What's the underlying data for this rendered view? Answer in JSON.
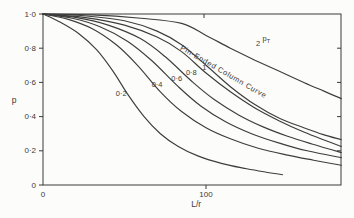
{
  "figure": {
    "background": "#fcfcfa",
    "frame_color": "#3a3a3a",
    "curve_color": "#3d3d3d",
    "text_color": "#3b3b3b"
  },
  "chart_data": {
    "type": "line",
    "title": "",
    "xlabel": "L/r",
    "ylabel": "p",
    "xlim": [
      0,
      183
    ],
    "ylim": [
      0,
      1.0
    ],
    "grid": false,
    "legend": "none",
    "xticks": {
      "values": [
        0,
        100
      ],
      "labels": [
        "0",
        "100"
      ]
    },
    "yticks": {
      "values": [
        1.0,
        0.8,
        0.6,
        0.4,
        0.2,
        0
      ],
      "labels": [
        "1·0",
        "0·8",
        "0·6",
        "0·4",
        "0·2",
        "0"
      ]
    },
    "right_tick_values": [
      0.8,
      0.6,
      0.4,
      0.2
    ],
    "top_tick_values": [
      100
    ],
    "series": [
      {
        "name": "curve-rho-0-2",
        "label": "0·2",
        "label_at": [
          48,
          0.52
        ],
        "points": [
          [
            0,
            1.0
          ],
          [
            10,
            0.955
          ],
          [
            22,
            0.885
          ],
          [
            33,
            0.79
          ],
          [
            43,
            0.665
          ],
          [
            52,
            0.53
          ],
          [
            62,
            0.4
          ],
          [
            72,
            0.3
          ],
          [
            83,
            0.225
          ],
          [
            95,
            0.17
          ],
          [
            110,
            0.125
          ],
          [
            125,
            0.095
          ],
          [
            137,
            0.075
          ],
          [
            147,
            0.06
          ]
        ]
      },
      {
        "name": "curve-rho-0-4",
        "label": "0·4",
        "label_at": [
          70,
          0.575
        ],
        "points": [
          [
            0,
            1.0
          ],
          [
            15,
            0.97
          ],
          [
            30,
            0.915
          ],
          [
            45,
            0.82
          ],
          [
            58,
            0.7
          ],
          [
            72,
            0.545
          ],
          [
            85,
            0.43
          ],
          [
            100,
            0.335
          ],
          [
            115,
            0.27
          ],
          [
            132,
            0.215
          ],
          [
            150,
            0.175
          ],
          [
            166,
            0.145
          ],
          [
            183,
            0.115
          ]
        ]
      },
      {
        "name": "curve-rho-0-6",
        "label": "0·6",
        "label_at": [
          82,
          0.61
        ],
        "points": [
          [
            0,
            1.0
          ],
          [
            18,
            0.975
          ],
          [
            35,
            0.925
          ],
          [
            52,
            0.84
          ],
          [
            67,
            0.725
          ],
          [
            83,
            0.575
          ],
          [
            97,
            0.46
          ],
          [
            112,
            0.37
          ],
          [
            128,
            0.3
          ],
          [
            145,
            0.245
          ],
          [
            162,
            0.2
          ],
          [
            183,
            0.16
          ]
        ]
      },
      {
        "name": "curve-rho-0-8",
        "label": "0·8",
        "label_at": [
          91,
          0.645
        ],
        "points": [
          [
            0,
            1.0
          ],
          [
            20,
            0.98
          ],
          [
            40,
            0.935
          ],
          [
            60,
            0.855
          ],
          [
            75,
            0.75
          ],
          [
            92,
            0.6
          ],
          [
            105,
            0.5
          ],
          [
            120,
            0.41
          ],
          [
            135,
            0.34
          ],
          [
            150,
            0.285
          ],
          [
            165,
            0.24
          ],
          [
            183,
            0.19
          ]
        ]
      },
      {
        "name": "curve-rho-1",
        "label": "1",
        "label_at": [
          99,
          0.675
        ],
        "points": [
          [
            0,
            1.0
          ],
          [
            25,
            0.98
          ],
          [
            50,
            0.935
          ],
          [
            70,
            0.865
          ],
          [
            85,
            0.78
          ],
          [
            100,
            0.655
          ],
          [
            115,
            0.545
          ],
          [
            130,
            0.45
          ],
          [
            145,
            0.375
          ],
          [
            160,
            0.31
          ],
          [
            172,
            0.265
          ],
          [
            183,
            0.225
          ]
        ]
      },
      {
        "name": "curve-pin-ended",
        "label": "",
        "label_at": [
          0,
          0
        ],
        "points": [
          [
            0,
            1.0
          ],
          [
            25,
            0.99
          ],
          [
            50,
            0.96
          ],
          [
            70,
            0.9
          ],
          [
            85,
            0.82
          ],
          [
            100,
            0.7
          ],
          [
            115,
            0.575
          ],
          [
            130,
            0.47
          ],
          [
            145,
            0.39
          ],
          [
            160,
            0.335
          ],
          [
            172,
            0.295
          ],
          [
            183,
            0.265
          ]
        ]
      },
      {
        "name": "curve-rho-2",
        "label": "2",
        "label_at": [
          132,
          0.81
        ],
        "points": [
          [
            0,
            1.0
          ],
          [
            30,
            0.995
          ],
          [
            60,
            0.975
          ],
          [
            85,
            0.945
          ],
          [
            100,
            0.875
          ],
          [
            115,
            0.8
          ],
          [
            130,
            0.73
          ],
          [
            145,
            0.665
          ],
          [
            160,
            0.6
          ],
          [
            172,
            0.55
          ],
          [
            183,
            0.505
          ]
        ]
      }
    ],
    "annotations": [
      {
        "name": "pin-ended-column-curve-label",
        "text": "Pin-Ended Column Curve",
        "at": [
          110,
          0.65
        ],
        "rotation": 30
      },
      {
        "name": "rho-t-label",
        "text_main": "p",
        "text_sub": "T",
        "at": [
          137,
          0.84
        ],
        "rotation": 0
      }
    ]
  }
}
